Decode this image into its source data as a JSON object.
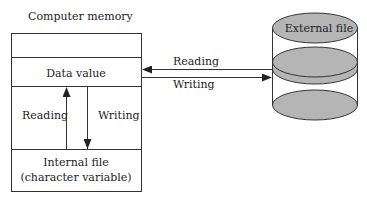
{
  "diagram": {
    "memory": {
      "title": "Computer memory",
      "data_value": "Data value",
      "internal_file_line1": "Internal file",
      "internal_file_line2": "(character variable)",
      "inner_reading": "Reading",
      "inner_writing": "Writing"
    },
    "external": {
      "label": "External file"
    },
    "arrows": {
      "reading": "Reading",
      "writing": "Writing"
    },
    "colors": {
      "line": "#333333",
      "disk_fill": "#b5b5b5",
      "background": "#ffffff"
    }
  }
}
